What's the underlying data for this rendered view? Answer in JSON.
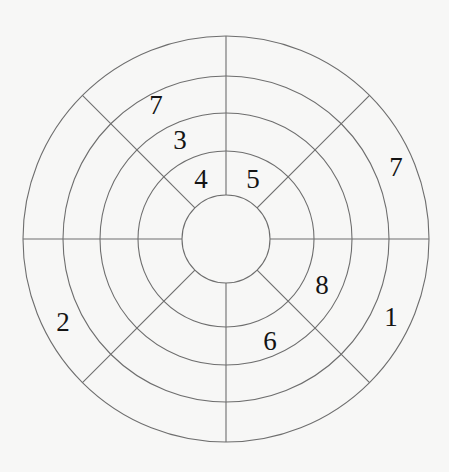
{
  "diagram": {
    "type": "concentric-ring-puzzle",
    "center": [
      226,
      239
    ],
    "radii": [
      44,
      88,
      126,
      163,
      203
    ],
    "spoke_angles_deg": [
      0,
      45,
      90,
      135,
      180,
      225,
      270,
      315
    ],
    "colors": {
      "line": "#6e6e6e",
      "text": "#141414",
      "background": "#f7f7f6"
    },
    "numbers": [
      {
        "id": "n1",
        "value": "7",
        "x": 156,
        "y": 105
      },
      {
        "id": "n2",
        "value": "3",
        "x": 180,
        "y": 140
      },
      {
        "id": "n3",
        "value": "4",
        "x": 201,
        "y": 179
      },
      {
        "id": "n4",
        "value": "5",
        "x": 253,
        "y": 179
      },
      {
        "id": "n5",
        "value": "7",
        "x": 396,
        "y": 167
      },
      {
        "id": "n6",
        "value": "2",
        "x": 63,
        "y": 322
      },
      {
        "id": "n7",
        "value": "8",
        "x": 322,
        "y": 285
      },
      {
        "id": "n8",
        "value": "6",
        "x": 270,
        "y": 341
      },
      {
        "id": "n9",
        "value": "1",
        "x": 391,
        "y": 317
      }
    ]
  }
}
